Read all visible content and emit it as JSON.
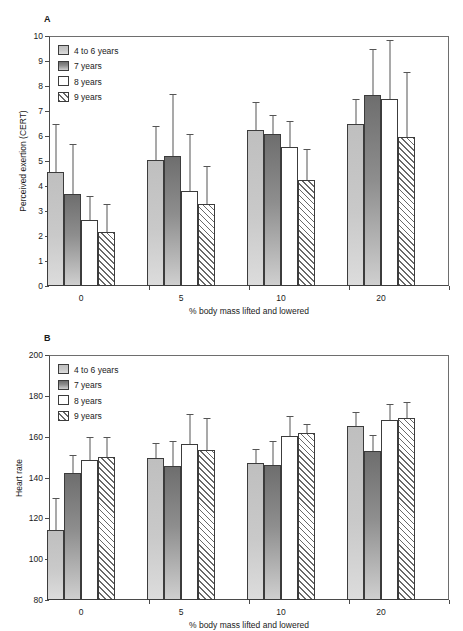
{
  "figure": {
    "panels": [
      {
        "letter": "A",
        "ylabel": "Perceived exertion (CERT)",
        "xlabel": "% body mass lifted and lowered",
        "yticks": [
          0,
          1,
          2,
          3,
          4,
          5,
          6,
          7,
          8,
          9,
          10
        ]
      },
      {
        "letter": "B",
        "ylabel": "Heart rate",
        "xlabel": "% body mass lifted and lowered",
        "yticks": [
          80,
          100,
          120,
          140,
          160,
          180,
          200
        ]
      }
    ],
    "legend": [
      {
        "label": "4 to 6 years",
        "style": "sw-g1"
      },
      {
        "label": "7 years",
        "style": "sw-g2"
      },
      {
        "label": "8 years",
        "style": "sw-g3"
      },
      {
        "label": "9 years",
        "style": "sw-g4"
      }
    ]
  },
  "chart_data": [
    {
      "type": "bar",
      "title": "A",
      "xlabel": "% body mass lifted and lowered",
      "ylabel": "Perceived exertion (CERT)",
      "ylim": [
        0,
        10
      ],
      "yticks": [
        0,
        1,
        2,
        3,
        4,
        5,
        6,
        7,
        8,
        9,
        10
      ],
      "categories": [
        "0",
        "5",
        "10",
        "20"
      ],
      "grid": false,
      "legend_position": "top-left",
      "series": [
        {
          "name": "4 to 6 years",
          "values": [
            4.55,
            5.03,
            6.25,
            6.5
          ],
          "err_upper": [
            6.5,
            6.4,
            7.35,
            7.5
          ]
        },
        {
          "name": "7 years",
          "values": [
            3.67,
            5.2,
            6.1,
            7.65
          ],
          "err_upper": [
            5.7,
            7.7,
            6.85,
            9.5
          ]
        },
        {
          "name": "8 years",
          "values": [
            2.65,
            3.8,
            5.55,
            7.5
          ],
          "err_upper": [
            3.6,
            6.1,
            6.6,
            9.85
          ]
        },
        {
          "name": "9 years",
          "values": [
            2.15,
            3.3,
            4.25,
            5.95
          ],
          "err_upper": [
            3.3,
            4.8,
            5.5,
            8.55
          ]
        }
      ]
    },
    {
      "type": "bar",
      "title": "B",
      "xlabel": "% body mass lifted and lowered",
      "ylabel": "Heart rate",
      "ylim": [
        80,
        200
      ],
      "yticks": [
        80,
        100,
        120,
        140,
        160,
        180,
        200
      ],
      "categories": [
        "0",
        "5",
        "10",
        "20"
      ],
      "grid": false,
      "legend_position": "top-left",
      "series": [
        {
          "name": "4 to 6 years",
          "values": [
            114.5,
            149.5,
            147,
            165
          ],
          "err_upper": [
            130,
            157,
            154,
            172
          ]
        },
        {
          "name": "7 years",
          "values": [
            142,
            145.5,
            146,
            153
          ],
          "err_upper": [
            151,
            158,
            158,
            161
          ]
        },
        {
          "name": "8 years",
          "values": [
            148.5,
            156.5,
            160.5,
            168
          ],
          "err_upper": [
            160,
            171,
            170,
            176
          ]
        },
        {
          "name": "9 years",
          "values": [
            150,
            153.5,
            162,
            169
          ],
          "err_upper": [
            160,
            169,
            166,
            177
          ]
        }
      ]
    }
  ]
}
